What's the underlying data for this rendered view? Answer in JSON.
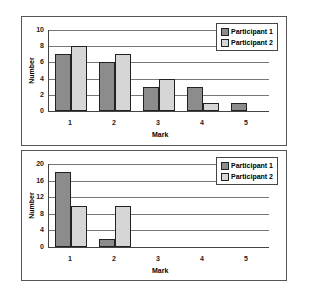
{
  "chart_data": [
    {
      "type": "bar",
      "categories": [
        "1",
        "2",
        "3",
        "4",
        "5"
      ],
      "series": [
        {
          "name": "Participant 1",
          "values": [
            7,
            6,
            3,
            3,
            1
          ],
          "color": "#8c8c8c"
        },
        {
          "name": "Participant 2",
          "values": [
            8,
            7,
            4,
            1,
            0
          ],
          "color": "#d6d6d6"
        }
      ],
      "xlabel": "Mark",
      "ylabel": "Number",
      "ylim": [
        0,
        10
      ],
      "yticks": [
        "0",
        "2",
        "4",
        "6",
        "8",
        "10"
      ],
      "grid": true,
      "legend_position": "upper right"
    },
    {
      "type": "bar",
      "categories": [
        "1",
        "2",
        "3",
        "4",
        "5"
      ],
      "series": [
        {
          "name": "Participant 1",
          "values": [
            18,
            2,
            0,
            0,
            0
          ],
          "color": "#8c8c8c"
        },
        {
          "name": "Participant 2",
          "values": [
            10,
            10,
            0,
            0,
            0
          ],
          "color": "#d6d6d6"
        }
      ],
      "xlabel": "Mark",
      "ylabel": "Number",
      "ylim": [
        0,
        20
      ],
      "yticks": [
        "0",
        "4",
        "8",
        "12",
        "16",
        "20"
      ],
      "grid": true,
      "legend_position": "upper right"
    }
  ]
}
